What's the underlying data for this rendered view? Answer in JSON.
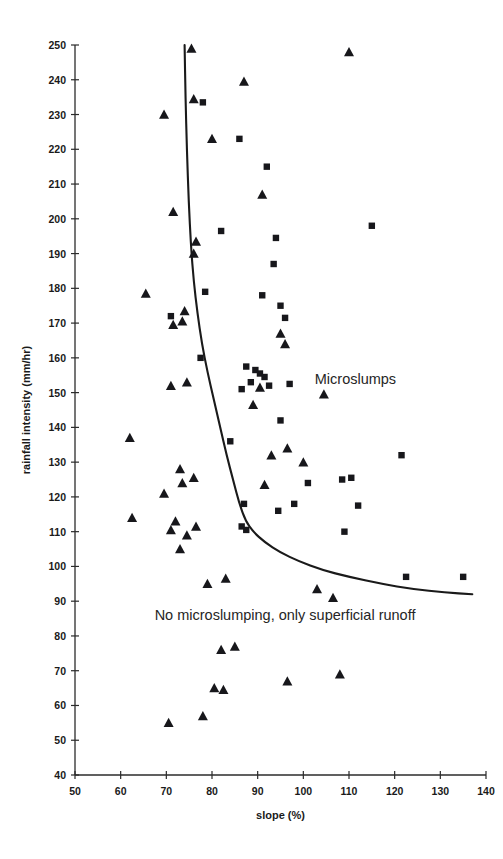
{
  "figure": {
    "annotations": {
      "upper_region": "Microslumps",
      "lower_region": "No microslumping, only superficial runoff"
    }
  },
  "chart_data": {
    "type": "scatter",
    "title": "",
    "xlabel": "slope (%)",
    "ylabel": "rainfall intensity (mm/hr)",
    "xlim": [
      50,
      140
    ],
    "ylim": [
      40,
      250
    ],
    "xticks": [
      50,
      60,
      70,
      80,
      90,
      100,
      110,
      120,
      130,
      140
    ],
    "yticks": [
      40,
      50,
      60,
      70,
      80,
      90,
      100,
      110,
      120,
      130,
      140,
      150,
      160,
      170,
      180,
      190,
      200,
      210,
      220,
      230,
      240,
      250
    ],
    "grid": false,
    "legend": "none",
    "marker_colors": {
      "triangle": "#17171b",
      "square": "#17171b"
    },
    "series": [
      {
        "name": "No microslumping, only superficial runoff",
        "marker": "triangle",
        "points": [
          [
            75.5,
            249.0
          ],
          [
            110.0,
            248.0
          ],
          [
            87.0,
            239.5
          ],
          [
            76.0,
            234.5
          ],
          [
            69.5,
            230.0
          ],
          [
            80.0,
            223.0
          ],
          [
            91.0,
            207.0
          ],
          [
            71.5,
            202.0
          ],
          [
            76.5,
            193.5
          ],
          [
            76.0,
            190.0
          ],
          [
            65.5,
            178.5
          ],
          [
            74.0,
            173.5
          ],
          [
            73.5,
            170.5
          ],
          [
            71.5,
            169.5
          ],
          [
            95.0,
            167.0
          ],
          [
            96.0,
            164.0
          ],
          [
            74.5,
            153.0
          ],
          [
            71.0,
            152.0
          ],
          [
            90.5,
            151.5
          ],
          [
            104.5,
            149.5
          ],
          [
            89.0,
            146.5
          ],
          [
            62.0,
            137.0
          ],
          [
            96.5,
            134.0
          ],
          [
            93.0,
            132.0
          ],
          [
            100.0,
            130.0
          ],
          [
            73.0,
            128.0
          ],
          [
            76.0,
            125.5
          ],
          [
            73.5,
            124.0
          ],
          [
            91.5,
            123.5
          ],
          [
            69.5,
            121.0
          ],
          [
            62.5,
            114.0
          ],
          [
            72.0,
            113.0
          ],
          [
            76.5,
            111.5
          ],
          [
            71.0,
            110.5
          ],
          [
            74.5,
            109.0
          ],
          [
            73.0,
            105.0
          ],
          [
            83.0,
            96.5
          ],
          [
            79.0,
            95.0
          ],
          [
            103.0,
            93.5
          ],
          [
            106.5,
            91.0
          ],
          [
            85.0,
            77.0
          ],
          [
            82.0,
            76.0
          ],
          [
            108.0,
            69.0
          ],
          [
            96.5,
            67.0
          ],
          [
            80.5,
            65.0
          ],
          [
            82.5,
            64.5
          ],
          [
            78.0,
            57.0
          ],
          [
            70.5,
            55.0
          ]
        ]
      },
      {
        "name": "Microslumps",
        "marker": "square",
        "points": [
          [
            78.0,
            233.5
          ],
          [
            115.0,
            198.0
          ],
          [
            86.0,
            223.0
          ],
          [
            92.0,
            215.0
          ],
          [
            82.0,
            196.5
          ],
          [
            94.0,
            194.5
          ],
          [
            93.5,
            187.0
          ],
          [
            78.5,
            179.0
          ],
          [
            91.0,
            178.0
          ],
          [
            95.0,
            175.0
          ],
          [
            71.0,
            172.0
          ],
          [
            96.0,
            171.5
          ],
          [
            77.5,
            160.0
          ],
          [
            87.5,
            157.5
          ],
          [
            89.5,
            156.5
          ],
          [
            90.5,
            155.5
          ],
          [
            91.5,
            154.5
          ],
          [
            88.5,
            153.0
          ],
          [
            92.5,
            152.0
          ],
          [
            86.5,
            151.0
          ],
          [
            97.0,
            152.5
          ],
          [
            95.0,
            142.0
          ],
          [
            121.5,
            132.0
          ],
          [
            84.0,
            136.0
          ],
          [
            110.5,
            125.5
          ],
          [
            108.5,
            125.0
          ],
          [
            101.0,
            124.0
          ],
          [
            112.0,
            117.5
          ],
          [
            87.0,
            118.0
          ],
          [
            98.0,
            118.0
          ],
          [
            86.5,
            111.5
          ],
          [
            87.5,
            110.5
          ],
          [
            109.0,
            110.0
          ],
          [
            94.5,
            116.0
          ],
          [
            122.5,
            97.0
          ],
          [
            135.0,
            97.0
          ]
        ]
      }
    ],
    "threshold_curve": {
      "name": "microslumping threshold",
      "points": [
        [
          74.0,
          250.0
        ],
        [
          74.2,
          235.0
        ],
        [
          74.5,
          220.0
        ],
        [
          74.9,
          205.0
        ],
        [
          75.4,
          192.0
        ],
        [
          76.0,
          182.0
        ],
        [
          76.8,
          173.0
        ],
        [
          77.8,
          164.0
        ],
        [
          79.0,
          156.0
        ],
        [
          80.4,
          148.0
        ],
        [
          81.8,
          140.0
        ],
        [
          83.2,
          132.0
        ],
        [
          84.6,
          125.0
        ],
        [
          86.0,
          118.0
        ],
        [
          87.4,
          113.0
        ],
        [
          89.0,
          110.0
        ],
        [
          91.5,
          107.0
        ],
        [
          95.0,
          104.0
        ],
        [
          99.0,
          101.5
        ],
        [
          104.0,
          99.0
        ],
        [
          110.0,
          97.0
        ],
        [
          117.0,
          95.0
        ],
        [
          124.0,
          93.5
        ],
        [
          131.0,
          92.5
        ],
        [
          137.0,
          92.0
        ]
      ]
    }
  }
}
